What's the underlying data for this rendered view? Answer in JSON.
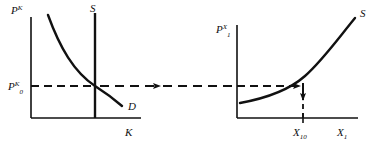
{
  "figure": {
    "name": "two-panel-supply-demand-transmission-diagram",
    "background_color": "#ffffff",
    "stroke_color": "#111111",
    "width": 389,
    "height": 143
  },
  "left_panel": {
    "name": "capital-market-panel",
    "y_axis_label": {
      "base": "P",
      "superscript": "K",
      "subscript": ""
    },
    "x_axis_label": {
      "base": "K",
      "superscript": "",
      "subscript": ""
    },
    "price_level_label": {
      "base": "P",
      "subscript": "0",
      "superscript": "K"
    },
    "supply_label": "S",
    "demand_label": "D",
    "supply_type": "vertical",
    "demand_type": "downward-sloping-convex"
  },
  "right_panel": {
    "name": "goods-market-panel",
    "y_axis_label": {
      "base": "P",
      "subscript": "1",
      "superscript": "X"
    },
    "x_axis_label": {
      "base": "X",
      "subscript": "1",
      "superscript": ""
    },
    "quantity_label": {
      "base": "X",
      "subscript": "10",
      "superscript": ""
    },
    "supply_label": "S",
    "supply_type": "upward-sloping-convex"
  },
  "connectors": {
    "dashed_transmission_arrow": "horizontal-dashed-arrow-left-to-right",
    "inner_arrow": "horizontal-dashed-arrow-to-supply-curve",
    "drop_arrow": "vertical-dashed-arrow-down-to-quantity-axis"
  }
}
